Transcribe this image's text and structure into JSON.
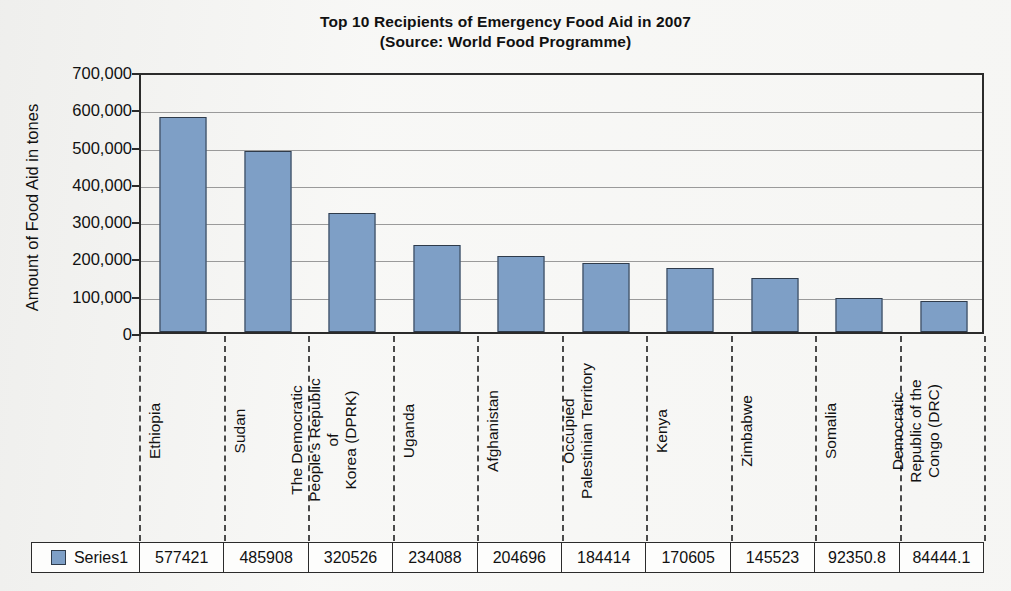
{
  "chart_data": {
    "type": "bar",
    "title": "Top 10 Recipients of Emergency Food Aid in 2007",
    "subtitle": "(Source: World Food Programme)",
    "xlabel": "",
    "ylabel": "Amount of Food Aid in tones",
    "ylim": [
      0,
      700000
    ],
    "ytick_labels": [
      "700,000",
      "600,000",
      "500,000",
      "400,000",
      "300,000",
      "200,000",
      "100,000",
      "0"
    ],
    "ytick_values": [
      700000,
      600000,
      500000,
      400000,
      300000,
      200000,
      100000,
      0
    ],
    "grid": "horizontal",
    "legend_position": "table-bottom",
    "series_name": "Series1",
    "series_color": "#7e9fc6",
    "categories": [
      "Ethiopia",
      "Sudan",
      "The Democratic\nPeople's Republic of\nKorea (DPRK)",
      "Uganda",
      "Afghanistan",
      "Occupied\nPalestinian Territory",
      "Kenya",
      "Zimbabwe",
      "Somalia",
      "Democratic\nRepublic of the\nCongo (DRC)"
    ],
    "values": [
      577421,
      485908,
      320526,
      234088,
      204696,
      184414,
      170605,
      145523,
      92350.8,
      84444.1
    ],
    "value_labels": [
      "577421",
      "485908",
      "320526",
      "234088",
      "204696",
      "184414",
      "170605",
      "145523",
      "92350.8",
      "84444.1"
    ]
  },
  "table": {
    "legend_label": "Series1"
  }
}
